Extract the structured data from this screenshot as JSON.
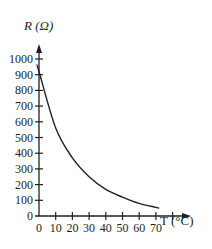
{
  "chart_data": {
    "type": "line",
    "title": "",
    "xlabel": "T (°C)",
    "ylabel": "R (Ω)",
    "xlim": [
      0,
      80
    ],
    "ylim": [
      0,
      1000
    ],
    "grid": false,
    "x_ticks": [
      "0",
      "10",
      "20",
      "30",
      "40",
      "50",
      "60",
      "70"
    ],
    "y_ticks": [
      "0",
      "100",
      "200",
      "300",
      "400",
      "500",
      "600",
      "700",
      "800",
      "900",
      "1000"
    ],
    "series": [
      {
        "name": "R vs T",
        "x": [
          0,
          10,
          20,
          30,
          40,
          50,
          60,
          70,
          72
        ],
        "y": [
          920,
          560,
          370,
          250,
          170,
          120,
          80,
          55,
          50
        ]
      }
    ]
  },
  "labels": {
    "y_axis": "R (Ω)",
    "x_axis": "T (°C)"
  },
  "colors": {
    "ink": "#231f20",
    "background": "#ffffff"
  }
}
